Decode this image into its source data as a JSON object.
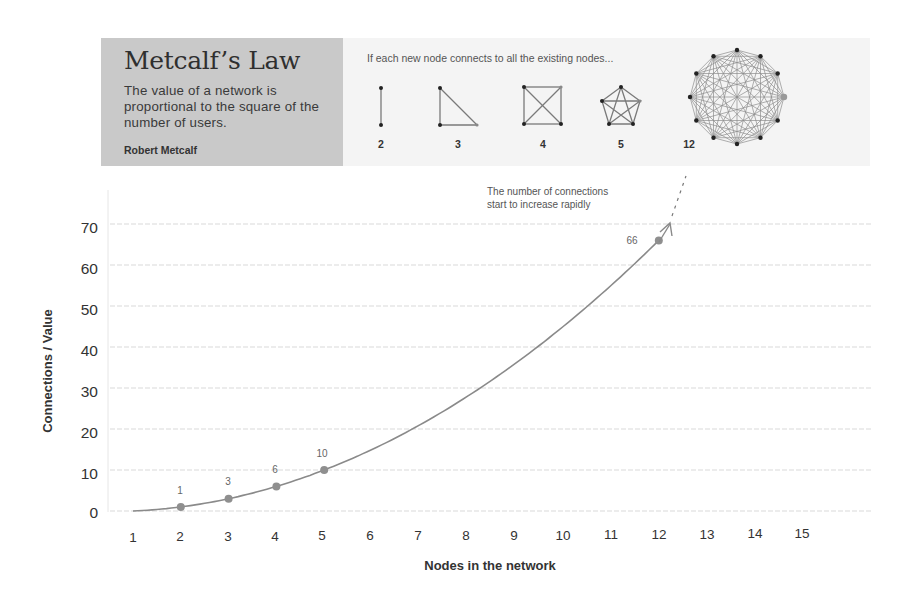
{
  "header": {
    "title": "Metcalf’s Law",
    "subtitle": "The value of a network is proportional to the square of the number of users.",
    "author": "Robert Metcalf"
  },
  "diagrams": {
    "caption": "If each new node connects to all the existing nodes...",
    "items": [
      {
        "nodes": 2,
        "label": "2"
      },
      {
        "nodes": 3,
        "label": "3"
      },
      {
        "nodes": 4,
        "label": "4"
      },
      {
        "nodes": 5,
        "label": "5"
      },
      {
        "nodes": 12,
        "label": "12"
      }
    ]
  },
  "annotation": {
    "line1": "The number of connections",
    "line2": "start to increase rapidly"
  },
  "colors": {
    "banner_left": "#c9c9c9",
    "banner_right": "#f4f4f4",
    "curve": "#8a8a8a",
    "point": "#8f8f8f",
    "grid": "#d0d0d0"
  },
  "chart_data": {
    "type": "line",
    "title": "Metcalf’s Law",
    "subtitle": "The value of a network is proportional to the square of the number of users.",
    "xlabel": "Nodes in the network",
    "ylabel": "Connections / Value",
    "x_ticks": [
      "1",
      "2",
      "3",
      "4",
      "5",
      "6",
      "7",
      "8",
      "9",
      "10",
      "11",
      "12",
      "13",
      "14",
      "15"
    ],
    "y_ticks": [
      "0",
      "10",
      "20",
      "30",
      "40",
      "50",
      "60",
      "70"
    ],
    "xlim": [
      1,
      15
    ],
    "ylim": [
      0,
      70
    ],
    "grid": "horizontal dashed",
    "legend": "none",
    "series": [
      {
        "name": "Connections n(n-1)/2",
        "x": [
          1,
          2,
          3,
          4,
          5,
          6,
          7,
          8,
          9,
          10,
          11,
          12
        ],
        "values": [
          0,
          1,
          3,
          6,
          10,
          15,
          21,
          28,
          36,
          45,
          55,
          66
        ]
      }
    ],
    "labeled_points": [
      {
        "x": 2,
        "y": 1,
        "label": "1"
      },
      {
        "x": 3,
        "y": 3,
        "label": "3"
      },
      {
        "x": 4,
        "y": 6,
        "label": "6"
      },
      {
        "x": 5,
        "y": 10,
        "label": "10"
      },
      {
        "x": 12,
        "y": 66,
        "label": "66"
      }
    ],
    "annotations": [
      "The number of connections start to increase rapidly"
    ]
  }
}
